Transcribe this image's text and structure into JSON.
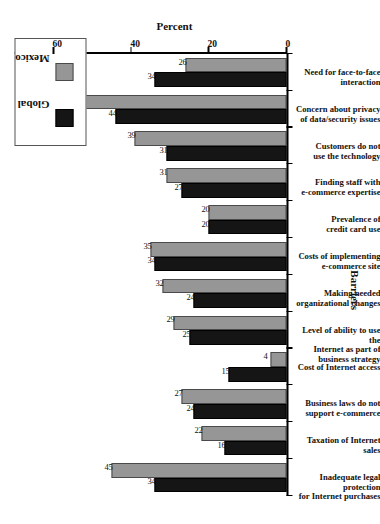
{
  "chart_data": {
    "type": "bar",
    "title": "",
    "orientation": "vertical-bars-on-rotated-page",
    "xlabel": "Barriers",
    "ylabel": "Percent",
    "ylim": [
      0,
      70
    ],
    "yticks": [
      0,
      20,
      40,
      60
    ],
    "ytick_labels": [
      "0",
      "20",
      "40",
      "60"
    ],
    "grid": false,
    "legend_position": "top-right",
    "categories": [
      "Inadequate legal protection\nfor Internet purchases",
      "Taxation of Internet sales",
      "Business laws do not\nsupport e-commerce",
      "Cost of Internet access",
      "Level of ability to use the\nInternet as part of business strategy",
      "Making needed\norganizational changes",
      "Costs of implementing\ne-commerce site",
      "Prevalence of\ncredit card use",
      "Finding staff with\ne-commerce expertise",
      "Customers do not\nuse the technology",
      "Concern about privacy\nof data/security issues",
      "Need for face-to-face\ninteraction"
    ],
    "series": [
      {
        "name": "Global",
        "color": "#151515",
        "values": [
          34,
          16,
          24,
          15,
          25,
          24,
          34,
          20,
          27,
          31,
          44,
          34
        ]
      },
      {
        "name": "Mexico",
        "color": "#969696",
        "values": [
          45,
          22,
          27,
          4,
          29,
          32,
          35,
          20,
          31,
          39,
          58,
          26
        ]
      }
    ]
  },
  "legend": {
    "entries": [
      {
        "label": "Global",
        "color": "#151515"
      },
      {
        "label": "Mexico",
        "color": "#969696"
      }
    ]
  },
  "axes": {
    "value_axis_title": "Percent",
    "category_axis_title": "Barriers"
  },
  "caption_fragment": ""
}
